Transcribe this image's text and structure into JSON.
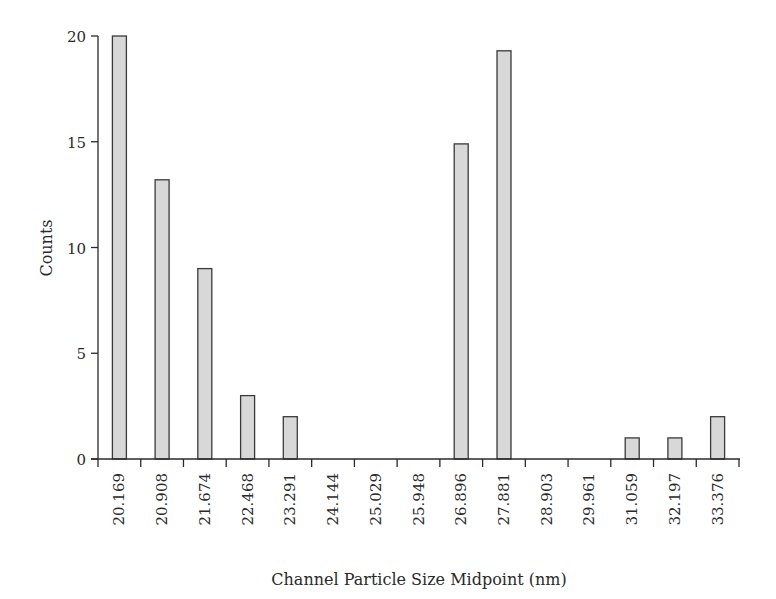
{
  "chart_data": {
    "type": "bar",
    "title": "",
    "xlabel": "Channel Particle Size Midpoint (nm)",
    "ylabel": "Counts",
    "categories": [
      "20.169",
      "20.908",
      "21.674",
      "22.468",
      "23.291",
      "24.144",
      "25.029",
      "25.948",
      "26.896",
      "27.881",
      "28.903",
      "29.961",
      "31.059",
      "32.197",
      "33.376"
    ],
    "values": [
      20,
      13.2,
      9,
      3,
      2,
      0,
      0,
      0,
      14.9,
      19.3,
      0,
      0,
      1,
      1,
      2
    ],
    "ylim": [
      0,
      20
    ],
    "yticks": [
      0,
      5,
      10,
      15,
      20
    ],
    "grid": false,
    "legend": null,
    "bar_color": "#d8d8d8",
    "bar_edge_color": "#3a3a3a"
  },
  "labels": {
    "xlabel": "Channel Particle Size Midpoint (nm)",
    "ylabel": "Counts"
  }
}
